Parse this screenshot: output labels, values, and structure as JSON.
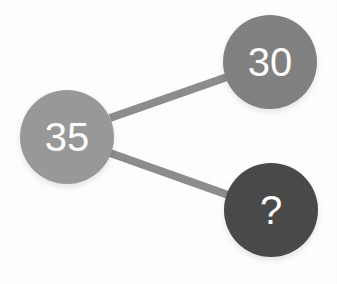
{
  "figure": {
    "background_color": "#ffffff",
    "width": 337,
    "height": 284
  },
  "nodes": [
    {
      "id": "node-35",
      "label": "35",
      "role": "source",
      "color": "#9a9a9a",
      "text_color": "#ffffff",
      "cx": 67,
      "cy": 137,
      "r": 47
    },
    {
      "id": "node-30",
      "label": "30",
      "role": "known-value",
      "color": "#828282",
      "text_color": "#ffffff",
      "cx": 270,
      "cy": 62,
      "r": 47
    },
    {
      "id": "node-unknown",
      "label": "?",
      "role": "unknown-value",
      "color": "#4a4a4a",
      "text_color": "#ffffff",
      "cx": 271,
      "cy": 210,
      "r": 47
    }
  ],
  "edges": [
    {
      "id": "edge-35-to-30",
      "from": "node-35",
      "to": "node-30",
      "color": "#8e8e8e",
      "width": 8,
      "x1": 110,
      "y1": 118,
      "x2": 230,
      "y2": 76
    },
    {
      "id": "edge-35-to-unknown",
      "from": "node-35",
      "to": "node-unknown",
      "color": "#8e8e8e",
      "width": 8,
      "x1": 110,
      "y1": 153,
      "x2": 231,
      "y2": 196
    }
  ]
}
